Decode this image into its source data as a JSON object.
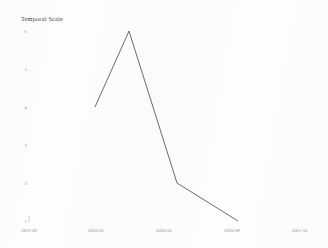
{
  "chart_data": {
    "type": "line",
    "title": "Temporal Scale",
    "xlabel": "",
    "ylabel": "",
    "grid": false,
    "legend": false,
    "x": [
      "2019-11",
      "2020-01",
      "2020-06",
      "2020-11"
    ],
    "values": [
      4.0,
      6.0,
      2.0,
      1.0
    ],
    "series": [
      {
        "name": "series-1",
        "values": [
          4.0,
          6.0,
          2.0,
          1.0
        ]
      }
    ],
    "xticks": [
      "2019-09",
      "2020-01",
      "2020-05",
      "2020-09",
      "2021-01"
    ],
    "yticks": [
      "6",
      "5",
      "4",
      "3",
      "2",
      "1"
    ],
    "ylim": [
      1,
      6
    ],
    "line_color": "#5a5a5a"
  },
  "axes": {
    "x_tick_labels": [
      {
        "label": "2019-09",
        "x": 29
      },
      {
        "label": "2020-01",
        "x": 96
      },
      {
        "label": "2020-05",
        "x": 164
      },
      {
        "label": "2020-09",
        "x": 232
      },
      {
        "label": "2021-01",
        "x": 300
      }
    ],
    "y_tick_labels": [
      {
        "label": "6",
        "y": 31
      },
      {
        "label": "5",
        "y": 69
      },
      {
        "label": "4",
        "y": 107
      },
      {
        "label": "3",
        "y": 145
      },
      {
        "label": "2",
        "y": 183
      },
      {
        "label": "1",
        "y": 221
      }
    ]
  },
  "geometry": {
    "line_points": "95,107 129,31 177,183 238,221",
    "vertices": [
      {
        "px": 95,
        "py": 107
      },
      {
        "px": 129,
        "py": 31
      },
      {
        "px": 177,
        "py": 183
      },
      {
        "px": 238,
        "py": 221
      }
    ],
    "x_axis_y": 222,
    "tick_mark_x": 29,
    "tick_mark_y_top": 216,
    "tick_mark_y_bottom": 222
  }
}
